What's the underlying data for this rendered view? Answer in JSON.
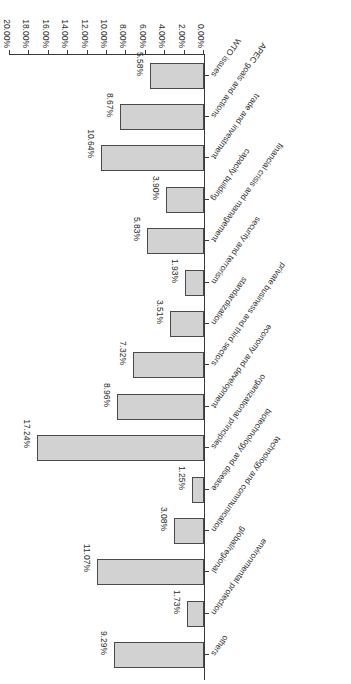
{
  "chart_data": {
    "type": "bar",
    "orientation": "horizontal",
    "title": "",
    "xlabel": "",
    "ylabel": "",
    "xlim": [
      0,
      0.2
    ],
    "grid": false,
    "legend": null,
    "value_format": "percent-2dp",
    "axis_ticks": [
      "0.00%",
      "2.00%",
      "4.00%",
      "6.00%",
      "8.00%",
      "10.00%",
      "12.00%",
      "14.00%",
      "16.00%",
      "18.00%",
      "20.00%"
    ],
    "axis_tick_values": [
      0,
      2,
      4,
      6,
      8,
      10,
      12,
      14,
      16,
      18,
      20
    ],
    "categories": [
      "WTO issues",
      "APEC goals and actions",
      "trade and investment",
      "capacity building",
      "financial crisis and management",
      "security and terrorism",
      "standardization",
      "private business and third sectors",
      "economy and development",
      "organizational principles",
      "biotechnology and disease",
      "technology and communication",
      "global/regional",
      "environmental protection",
      "others"
    ],
    "values": [
      5.58,
      8.67,
      10.64,
      3.9,
      5.83,
      1.93,
      3.51,
      7.32,
      8.96,
      17.24,
      1.25,
      3.08,
      11.07,
      1.73,
      9.29
    ],
    "value_labels": [
      "5.58%",
      "8.67%",
      "10.64%",
      "3.90%",
      "5.83%",
      "1.93%",
      "3.51%",
      "7.32%",
      "8.96%",
      "17.24%",
      "1.25%",
      "3.08%",
      "11.07%",
      "1.73%",
      "9.29%"
    ],
    "bar_color": "#d2d2d2",
    "bar_border_color": "#4a4a4a",
    "axis_color": "#3a3a3a",
    "background": "#ffffff"
  }
}
